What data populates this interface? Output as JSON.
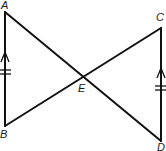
{
  "diagram": {
    "type": "geometry",
    "points": {
      "A": {
        "label": "A",
        "x": 5,
        "y": 12
      },
      "B": {
        "label": "B",
        "x": 5,
        "y": 126
      },
      "C": {
        "label": "C",
        "x": 161,
        "y": 28
      },
      "D": {
        "label": "D",
        "x": 161,
        "y": 141
      },
      "E": {
        "label": "E",
        "x": 82,
        "y": 75
      }
    },
    "segments": [
      "AB",
      "CD",
      "AD",
      "BC"
    ],
    "markings": {
      "AB": {
        "parallel_arrow": "up",
        "congruence_ticks": 2
      },
      "CD": {
        "parallel_arrow": "up",
        "congruence_ticks": 2
      }
    },
    "colors": {
      "line": "#111111",
      "background": "#ffffff"
    }
  }
}
